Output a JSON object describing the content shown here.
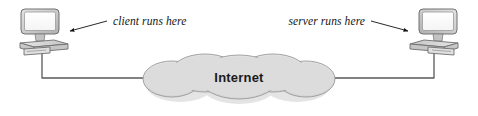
{
  "diagram": {
    "background_color": "#ffffff"
  },
  "cloud": {
    "label": "Internet",
    "fill_color": "#dcdcdc",
    "stroke_color": "#8c8c8c",
    "bounds": {
      "x": 145,
      "y": 58,
      "width": 188,
      "height": 44
    }
  },
  "nodes": [
    {
      "id": "client",
      "icon": "desktop-computer-icon",
      "screen_color": "#ffffff",
      "body_color": "#cfcfcf",
      "outline_color": "#6e6e6e",
      "position": {
        "x": 14,
        "y": 8,
        "width": 58,
        "height": 48
      }
    },
    {
      "id": "server",
      "icon": "desktop-computer-icon",
      "screen_color": "#ffffff",
      "body_color": "#cfcfcf",
      "outline_color": "#6e6e6e",
      "position": {
        "x": 404,
        "y": 8,
        "width": 58,
        "height": 48
      }
    }
  ],
  "annotations": [
    {
      "id": "client-annotation",
      "text": "client runs here",
      "text_x": 112,
      "text_y": 26,
      "anchor": "start",
      "arrow": {
        "x1": 108,
        "y1": 22,
        "x2": 68,
        "y2": 31
      }
    },
    {
      "id": "server-annotation",
      "text": "server runs here",
      "text_x": 364,
      "text_y": 26,
      "anchor": "end",
      "arrow": {
        "x1": 368,
        "y1": 22,
        "x2": 408,
        "y2": 31
      }
    }
  ],
  "links": [
    {
      "id": "client-link",
      "from": "client",
      "to": "cloud",
      "color": "#555555",
      "path": "M 42 50 L 42 78 L 149 78"
    },
    {
      "id": "server-link",
      "from": "server",
      "to": "cloud",
      "color": "#555555",
      "path": "M 434 50 L 434 78 L 329 78"
    }
  ]
}
